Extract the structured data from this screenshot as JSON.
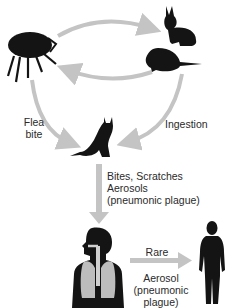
{
  "diagram": {
    "nodes": [
      {
        "id": "flea",
        "icon": "flea-icon"
      },
      {
        "id": "rabbit",
        "icon": "rabbit-icon"
      },
      {
        "id": "rodent",
        "icon": "rat-icon"
      },
      {
        "id": "cat",
        "icon": "cat-icon"
      },
      {
        "id": "human_infected",
        "icon": "human-respiratory-icon"
      },
      {
        "id": "human_contact",
        "icon": "human-silhouette-icon"
      }
    ],
    "labels": {
      "flea_bite_line1": "Flea",
      "flea_bite_line2": "bite",
      "ingestion": "Ingestion",
      "cat_to_human_line1": "Bites, Scratches",
      "cat_to_human_line2": "Aerosols",
      "cat_to_human_line3": "(pneumonic plague)",
      "rare": "Rare",
      "aerosol_line1": "Aerosol",
      "aerosol_line2": "(pneumonic",
      "aerosol_line3": "plague)"
    },
    "colors": {
      "arrow": "#c4c4c4",
      "silhouette": "#141414",
      "lungs": "#bdbdbd",
      "background": "#ffffff"
    }
  }
}
